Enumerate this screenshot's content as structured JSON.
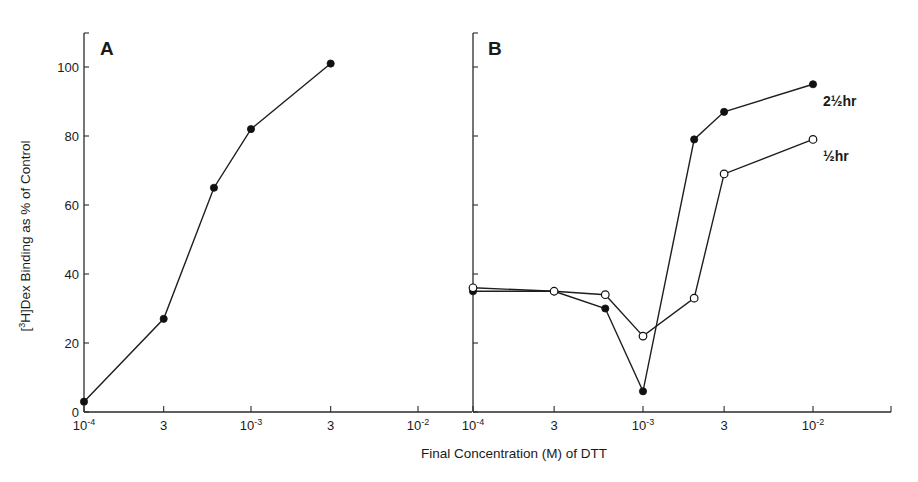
{
  "chart_data": [
    {
      "type": "line",
      "panel": "A",
      "panel_label": "A",
      "xscale": "log",
      "xlim": [
        0.0001,
        0.01
      ],
      "ylim": [
        0,
        110
      ],
      "x_ticks": [
        {
          "value": 0.0001,
          "base": "10",
          "exp": "-4"
        },
        {
          "value": 0.0003,
          "base": "3",
          "exp": ""
        },
        {
          "value": 0.001,
          "base": "10",
          "exp": "-3"
        },
        {
          "value": 0.003,
          "base": "3",
          "exp": ""
        },
        {
          "value": 0.01,
          "base": "10",
          "exp": "-2"
        }
      ],
      "y_ticks": [
        0,
        20,
        40,
        60,
        80,
        100
      ],
      "series": [
        {
          "name": "A",
          "marker": "filled",
          "x": [
            0.0001,
            0.0003,
            0.0006,
            0.001,
            0.003
          ],
          "y": [
            3,
            27,
            65,
            82,
            101
          ]
        }
      ]
    },
    {
      "type": "line",
      "panel": "B",
      "panel_label": "B",
      "xscale": "log",
      "xlim": [
        0.0001,
        0.025
      ],
      "ylim": [
        0,
        110
      ],
      "x_ticks": [
        {
          "value": 0.0001,
          "base": "10",
          "exp": "-4"
        },
        {
          "value": 0.0003,
          "base": "3",
          "exp": ""
        },
        {
          "value": 0.001,
          "base": "10",
          "exp": "-3"
        },
        {
          "value": 0.003,
          "base": "3",
          "exp": ""
        },
        {
          "value": 0.01,
          "base": "10",
          "exp": "-2"
        }
      ],
      "y_ticks": [
        0,
        20,
        40,
        60,
        80,
        100
      ],
      "series": [
        {
          "name": "2½ hr",
          "label": "2½hr",
          "marker": "filled",
          "x": [
            0.0001,
            0.0003,
            0.0006,
            0.001,
            0.002,
            0.003,
            0.01
          ],
          "y": [
            35,
            35,
            30,
            6,
            79,
            87,
            95
          ]
        },
        {
          "name": "½ hr",
          "label": "½hr",
          "marker": "open",
          "x": [
            0.0001,
            0.0003,
            0.0006,
            0.001,
            0.002,
            0.003,
            0.01
          ],
          "y": [
            36,
            35,
            34,
            22,
            33,
            69,
            79
          ]
        }
      ]
    }
  ],
  "ylabel": {
    "prefix": "[",
    "sup": "3",
    "rest": "H]Dex Binding as % of Control"
  },
  "xlabel": "Final Concentration (M) of DTT"
}
